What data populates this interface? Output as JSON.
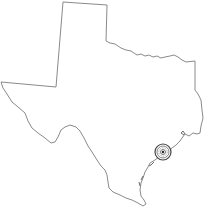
{
  "map": {
    "region": "Texas",
    "outline_color": "#8a8a8a",
    "background": "#ffffff",
    "marker": {
      "type": "target-compass",
      "location_hint": "Houston / Galveston Bay area",
      "x": 163,
      "y": 152,
      "color": "#444444"
    }
  }
}
